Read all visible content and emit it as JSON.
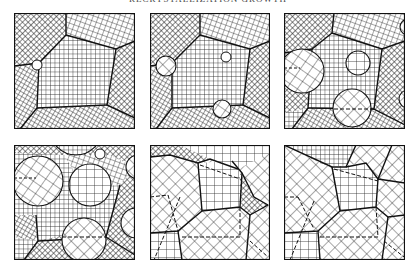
{
  "figure": {
    "caption_partial": "RECRYSTALLIZATION GROWTH",
    "colors": {
      "ink": "#1a1a1a",
      "background": "#ffffff"
    },
    "panels": [
      {
        "id": 1,
        "label": "stage-1",
        "row": 1,
        "col": 1,
        "nuclei": 1
      },
      {
        "id": 2,
        "label": "stage-2",
        "row": 1,
        "col": 2,
        "nuclei": 3
      },
      {
        "id": 3,
        "label": "stage-3",
        "row": 1,
        "col": 3,
        "nuclei": 5
      },
      {
        "id": 4,
        "label": "stage-4",
        "row": 2,
        "col": 1,
        "nuclei": 7
      },
      {
        "id": 5,
        "label": "stage-5",
        "row": 2,
        "col": 2,
        "nuclei": "impinged"
      },
      {
        "id": 6,
        "label": "stage-6",
        "row": 2,
        "col": 3,
        "nuclei": "complete"
      }
    ],
    "hatch_patterns": [
      "fine-diagonal-crosshatch",
      "square-grid",
      "tilted-grid",
      "coarse-diagonal-grid"
    ]
  }
}
